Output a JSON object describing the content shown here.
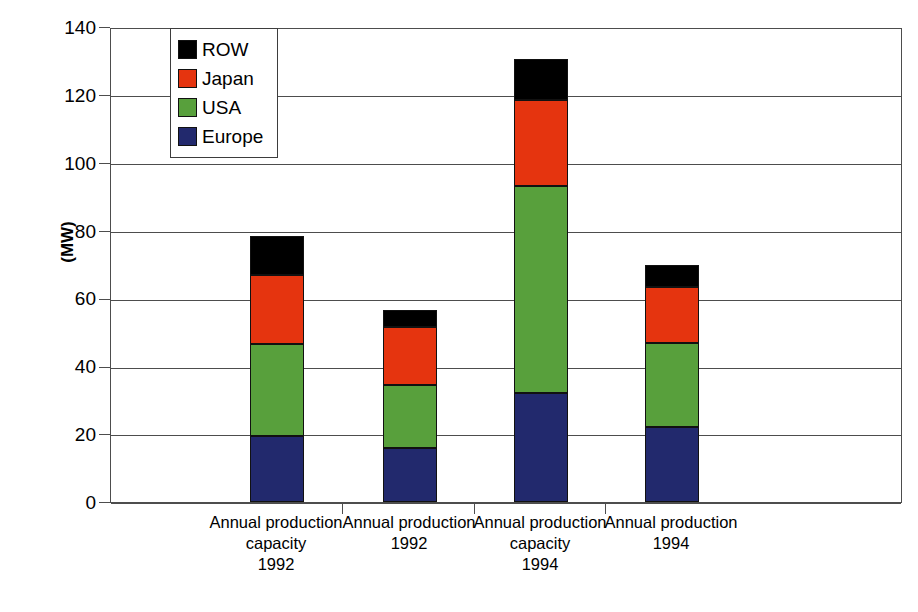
{
  "chart_data": {
    "type": "bar",
    "subtype": "stacked-bar",
    "title": "",
    "xlabel": "",
    "ylabel": "(MW)",
    "ylim": [
      0,
      140
    ],
    "ytick_step": 20,
    "yticks": [
      140,
      120,
      100,
      80,
      60,
      40,
      20,
      0
    ],
    "grid": true,
    "legend_position": "top-left-inside",
    "categories": [
      "Annual production\ncapacity\n1992",
      "Annual production\n1992",
      "Annual production\ncapacity\n1994",
      "Annual production\n1994"
    ],
    "series": [
      {
        "name": "Europe",
        "color": "#22296d",
        "values": [
          19.5,
          16.0,
          32.0,
          22.0
        ]
      },
      {
        "name": "USA",
        "color": "#58a03c",
        "values": [
          27.0,
          18.5,
          61.0,
          25.0
        ]
      },
      {
        "name": "Japan",
        "color": "#e5340f",
        "values": [
          20.5,
          17.0,
          25.5,
          16.5
        ]
      },
      {
        "name": "ROW",
        "color": "#000000",
        "values": [
          11.5,
          5.0,
          12.0,
          6.5
        ]
      }
    ],
    "stack_order_bottom_to_top": [
      "Europe",
      "USA",
      "Japan",
      "ROW"
    ],
    "totals": [
      78.5,
      56.5,
      130.5,
      70.0
    ]
  },
  "legend": {
    "items": [
      {
        "label": "ROW",
        "color": "#000000"
      },
      {
        "label": "Japan",
        "color": "#e5340f"
      },
      {
        "label": "USA",
        "color": "#58a03c"
      },
      {
        "label": "Europe",
        "color": "#22296d"
      }
    ]
  },
  "axis": {
    "y_title": "(MW)",
    "y_tick_labels": [
      "140",
      "120",
      "100",
      "80",
      "60",
      "40",
      "20",
      "0"
    ],
    "x_tick_labels": [
      "Annual production\ncapacity\n1992",
      "Annual production\n1992",
      "Annual production\ncapacity\n1994",
      "Annual production\n1994"
    ]
  }
}
